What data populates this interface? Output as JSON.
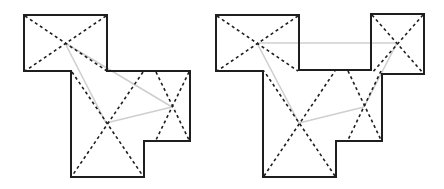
{
  "figures": [
    {
      "name": "left-floorplan",
      "description": "Polygon room with three dashed-diagonal regions and light gray links between region centers",
      "regions": 3,
      "links": 3
    },
    {
      "name": "right-floorplan",
      "description": "Polygon room with four dashed-diagonal regions and light gray links between region centers",
      "regions": 4,
      "links": 4
    }
  ],
  "colors": {
    "outline": "#1e1e1e",
    "diagonal": "#1e1e1e",
    "link": "#cfcfcf",
    "background": "#ffffff"
  }
}
